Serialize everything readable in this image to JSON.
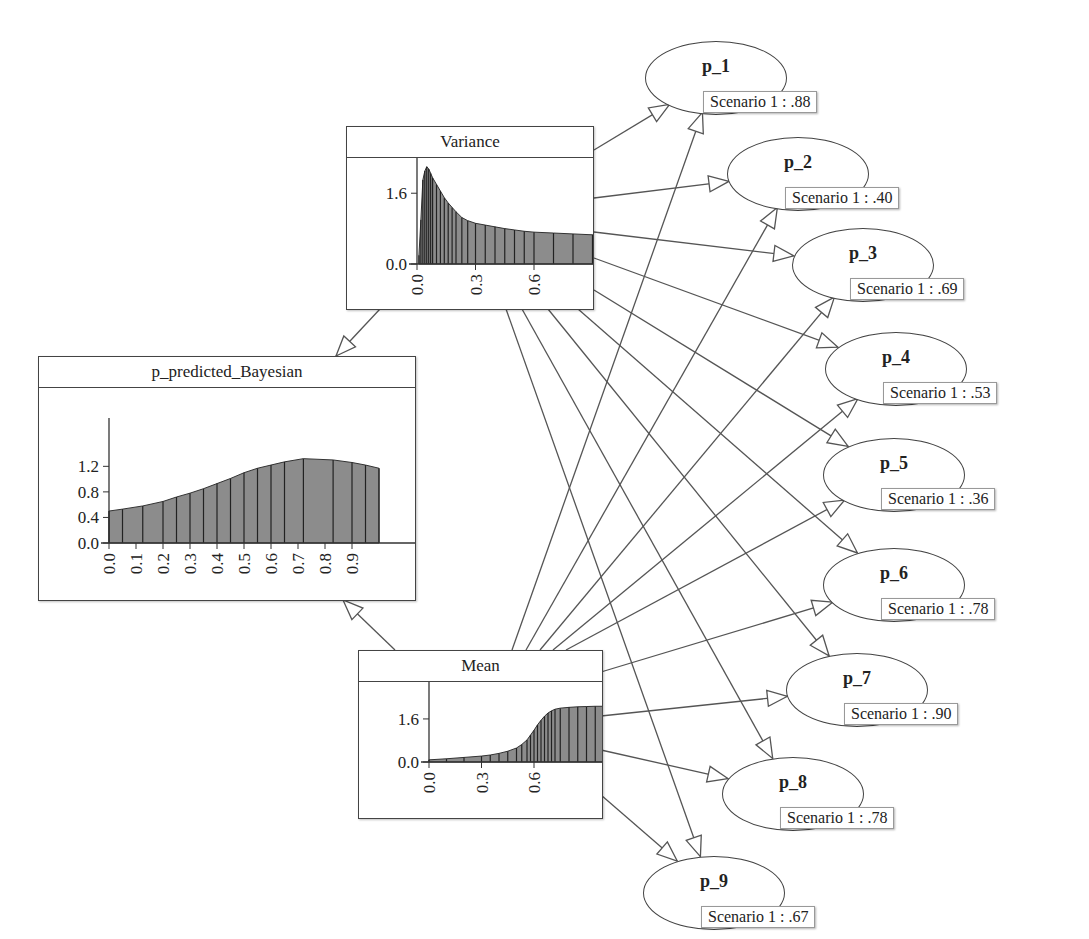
{
  "diagram": {
    "type": "bayesian-network",
    "nodes": {
      "variance": {
        "title": "Variance"
      },
      "predicted": {
        "title": "p_predicted_Bayesian"
      },
      "mean": {
        "title": "Mean"
      }
    },
    "observed": [
      {
        "label": "p_1",
        "evidence": "Scenario 1 : .88"
      },
      {
        "label": "p_2",
        "evidence": "Scenario 1 : .40"
      },
      {
        "label": "p_3",
        "evidence": "Scenario 1 : .69"
      },
      {
        "label": "p_4",
        "evidence": "Scenario 1 : .53"
      },
      {
        "label": "p_5",
        "evidence": "Scenario 1 : .36"
      },
      {
        "label": "p_6",
        "evidence": "Scenario 1 : .78"
      },
      {
        "label": "p_7",
        "evidence": "Scenario 1 : .90"
      },
      {
        "label": "p_8",
        "evidence": "Scenario 1 : .78"
      },
      {
        "label": "p_9",
        "evidence": "Scenario 1 : .67"
      }
    ],
    "edges": [
      [
        "Variance",
        "p_predicted_Bayesian"
      ],
      [
        "Mean",
        "p_predicted_Bayesian"
      ],
      [
        "Variance",
        "p_1"
      ],
      [
        "Variance",
        "p_2"
      ],
      [
        "Variance",
        "p_3"
      ],
      [
        "Variance",
        "p_4"
      ],
      [
        "Variance",
        "p_5"
      ],
      [
        "Variance",
        "p_6"
      ],
      [
        "Variance",
        "p_7"
      ],
      [
        "Variance",
        "p_8"
      ],
      [
        "Variance",
        "p_9"
      ],
      [
        "Mean",
        "p_1"
      ],
      [
        "Mean",
        "p_2"
      ],
      [
        "Mean",
        "p_3"
      ],
      [
        "Mean",
        "p_4"
      ],
      [
        "Mean",
        "p_5"
      ],
      [
        "Mean",
        "p_6"
      ],
      [
        "Mean",
        "p_7"
      ],
      [
        "Mean",
        "p_8"
      ],
      [
        "Mean",
        "p_9"
      ]
    ]
  },
  "chart_data": [
    {
      "type": "bar",
      "title": "Variance",
      "xlabel": "",
      "ylabel": "",
      "x_ticks": [
        "0.0",
        "0.3",
        "0.6"
      ],
      "y_ticks": [
        "0.0",
        "1.6"
      ],
      "xlim": [
        0,
        1.0
      ],
      "ylim": [
        0,
        2.6
      ],
      "x": [
        0.01,
        0.02,
        0.03,
        0.04,
        0.05,
        0.06,
        0.07,
        0.08,
        0.1,
        0.12,
        0.14,
        0.16,
        0.18,
        0.2,
        0.23,
        0.26,
        0.3,
        0.35,
        0.4,
        0.45,
        0.5,
        0.55,
        0.6,
        0.7,
        0.8,
        0.9,
        0.95,
        1.0
      ],
      "values": [
        0.2,
        1.0,
        1.9,
        2.1,
        2.2,
        2.15,
        2.05,
        1.95,
        1.8,
        1.65,
        1.5,
        1.38,
        1.28,
        1.18,
        1.05,
        0.98,
        0.92,
        0.88,
        0.84,
        0.8,
        0.77,
        0.74,
        0.72,
        0.7,
        0.68,
        0.66,
        0.64,
        0.63
      ]
    },
    {
      "type": "bar",
      "title": "p_predicted_Bayesian",
      "xlabel": "",
      "ylabel": "",
      "x_ticks": [
        "0.0",
        "0.1",
        "0.2",
        "0.3",
        "0.4",
        "0.5",
        "0.6",
        "0.7",
        "0.8",
        "0.9"
      ],
      "y_ticks": [
        "0.0",
        "0.4",
        "0.8",
        "1.2"
      ],
      "xlim": [
        0,
        1.0
      ],
      "ylim": [
        0,
        1.8
      ],
      "x": [
        0.0,
        0.05,
        0.125,
        0.2,
        0.25,
        0.3,
        0.35,
        0.4,
        0.45,
        0.5,
        0.55,
        0.6,
        0.65,
        0.72,
        0.83,
        0.9,
        0.95,
        1.0
      ],
      "values": [
        0.5,
        0.53,
        0.58,
        0.65,
        0.72,
        0.78,
        0.85,
        0.93,
        1.01,
        1.1,
        1.17,
        1.22,
        1.27,
        1.32,
        1.3,
        1.26,
        1.22,
        1.17
      ]
    },
    {
      "type": "bar",
      "title": "Mean",
      "xlabel": "",
      "ylabel": "",
      "x_ticks": [
        "0.0",
        "0.3",
        "0.6"
      ],
      "y_ticks": [
        "0.0",
        "1.6"
      ],
      "xlim": [
        0,
        1.0
      ],
      "ylim": [
        0,
        2.6
      ],
      "x": [
        0.0,
        0.1,
        0.2,
        0.3,
        0.35,
        0.4,
        0.45,
        0.5,
        0.53,
        0.56,
        0.58,
        0.6,
        0.62,
        0.64,
        0.66,
        0.68,
        0.7,
        0.72,
        0.75,
        0.8,
        0.85,
        0.9,
        0.95,
        1.0
      ],
      "values": [
        0.08,
        0.12,
        0.17,
        0.22,
        0.26,
        0.32,
        0.4,
        0.52,
        0.65,
        0.82,
        1.0,
        1.18,
        1.38,
        1.55,
        1.7,
        1.82,
        1.9,
        1.96,
        2.0,
        2.03,
        2.05,
        2.06,
        2.07,
        2.07
      ]
    }
  ]
}
